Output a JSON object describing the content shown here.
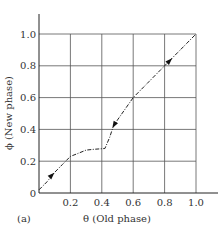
{
  "chart_data": {
    "type": "line",
    "title": "",
    "panel_label": "(a)",
    "xlabel": "θ (Old phase)",
    "ylabel": "ϕ (New phase)",
    "xlim": [
      0,
      1.0
    ],
    "ylim": [
      0,
      1.0
    ],
    "grid": true,
    "x_ticks": [
      "0.2",
      "0.4",
      "0.6",
      "0.8",
      "1.0"
    ],
    "y_ticks": [
      "0",
      "0.2",
      "0.4",
      "0.6",
      "0.8",
      "1.0"
    ],
    "series": [
      {
        "name": "phase map",
        "style": "dash-dot",
        "x": [
          0.0,
          0.05,
          0.1,
          0.15,
          0.2,
          0.25,
          0.3,
          0.35,
          0.42,
          0.45,
          0.47,
          0.5,
          0.55,
          0.6,
          0.7,
          0.8,
          0.9,
          1.0
        ],
        "y": [
          0.02,
          0.07,
          0.13,
          0.18,
          0.23,
          0.25,
          0.27,
          0.275,
          0.28,
          0.35,
          0.41,
          0.46,
          0.53,
          0.6,
          0.7,
          0.8,
          0.9,
          1.0
        ]
      }
    ],
    "arrows": [
      {
        "x": 0.08,
        "y": 0.11,
        "direction": "up-right"
      },
      {
        "x": 0.48,
        "y": 0.43,
        "direction": "down-left"
      },
      {
        "x": 0.83,
        "y": 0.83,
        "direction": "up-right"
      }
    ]
  }
}
